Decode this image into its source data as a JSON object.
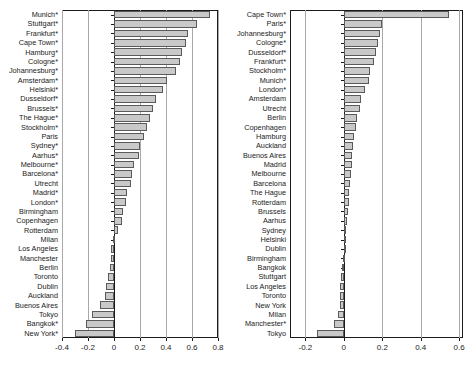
{
  "chart_data": [
    {
      "type": "bar",
      "orientation": "horizontal",
      "title": "",
      "xlabel": "",
      "ylabel": "",
      "xlim": [
        -0.4,
        0.8
      ],
      "xticks": [
        -0.4,
        -0.2,
        0,
        0.2,
        0.4,
        0.6,
        0.8
      ],
      "xticklabels": [
        "-0.4",
        "-0.2",
        "0",
        "0.2",
        "0.4",
        "0.6",
        "0.8"
      ],
      "grid": true,
      "legend": "none",
      "categories": [
        "Munich*",
        "Stuttgart*",
        "Frankfurt*",
        "Cape Town*",
        "Hamburg*",
        "Cologne*",
        "Johannesburg*",
        "Amsterdam*",
        "Helsinki*",
        "Dusseldorf*",
        "Brussels*",
        "The Hague*",
        "Stockholm*",
        "Paris",
        "Sydney*",
        "Aarhus*",
        "Melbourne*",
        "Barcelona*",
        "Utrecht",
        "Madrid*",
        "London*",
        "Birmingham",
        "Copenhagen",
        "Rotterdam",
        "Milan",
        "Los Angeles",
        "Manchester",
        "Berlin",
        "Toronto",
        "Dublin",
        "Auckland",
        "Buenos Aires",
        "Tokyo",
        "Bangkok*",
        "New York*"
      ],
      "values": [
        0.74,
        0.64,
        0.57,
        0.55,
        0.52,
        0.51,
        0.48,
        0.41,
        0.38,
        0.32,
        0.3,
        0.28,
        0.25,
        0.23,
        0.2,
        0.19,
        0.15,
        0.14,
        0.13,
        0.1,
        0.09,
        0.07,
        0.06,
        0.03,
        -0.01,
        -0.02,
        -0.02,
        -0.03,
        -0.05,
        -0.06,
        -0.07,
        -0.11,
        -0.17,
        -0.215,
        -0.3
      ]
    },
    {
      "type": "bar",
      "orientation": "horizontal",
      "title": "",
      "xlabel": "",
      "ylabel": "",
      "xlim": [
        -0.28,
        0.62
      ],
      "xticks": [
        -0.2,
        0,
        0.2,
        0.4,
        0.6
      ],
      "xticklabels": [
        "-0.2",
        "0",
        "0.2",
        "0.4",
        "0.6"
      ],
      "grid": true,
      "legend": "none",
      "categories": [
        "Cape Town*",
        "Paris*",
        "Johannesburg*",
        "Cologne*",
        "Dusseldorf*",
        "Frankfurt*",
        "Stockholm*",
        "Munich*",
        "London*",
        "Amsterdam",
        "Utrecht",
        "Berlin",
        "Copenhagen",
        "Hamburg",
        "Auckland",
        "Buenos Aires",
        "Madrid",
        "Melbourne",
        "Barcelona",
        "The Hague",
        "Rotterdam",
        "Brussels",
        "Aarhus",
        "Sydney",
        "Helsinki",
        "Dublin",
        "Birmingham",
        "Bangkok",
        "Stuttgart",
        "Los Angeles",
        "Toronto",
        "New York",
        "Milan",
        "Manchester*",
        "Tokyo"
      ],
      "values": [
        0.545,
        0.2,
        0.19,
        0.177,
        0.17,
        0.155,
        0.135,
        0.13,
        0.112,
        0.09,
        0.082,
        0.07,
        0.062,
        0.055,
        0.048,
        0.042,
        0.04,
        0.036,
        0.034,
        0.029,
        0.026,
        0.022,
        0.019,
        0.01,
        0.003,
        0.001,
        -0.005,
        -0.008,
        -0.016,
        -0.018,
        -0.02,
        -0.022,
        -0.028,
        -0.052,
        -0.14
      ]
    }
  ],
  "colors": {
    "bar_fill": "#c9c9c9",
    "bar_edge": "#5a5a5a",
    "axis": "#1b1b1b",
    "grid": "#a8a8a8",
    "background": "#ffffff"
  }
}
